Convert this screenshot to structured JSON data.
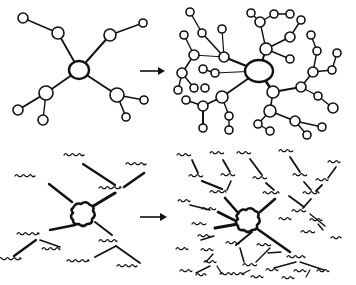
{
  "diagram": {
    "title": "",
    "panels": [
      {
        "id": "simple-network",
        "kind": "node-graph",
        "hub": {
          "x": 79,
          "y": 70,
          "rx": 10,
          "ry": 9
        },
        "nodes": [
          {
            "x": 23,
            "y": 18,
            "r": 5
          },
          {
            "x": 58,
            "y": 33,
            "r": 6
          },
          {
            "x": 110,
            "y": 35,
            "r": 6
          },
          {
            "x": 143,
            "y": 23,
            "r": 4
          },
          {
            "x": 46,
            "y": 93,
            "r": 7
          },
          {
            "x": 18,
            "y": 110,
            "r": 5
          },
          {
            "x": 43,
            "y": 120,
            "r": 5
          },
          {
            "x": 117,
            "y": 95,
            "r": 7
          },
          {
            "x": 144,
            "y": 100,
            "r": 4
          },
          {
            "x": 126,
            "y": 117,
            "r": 4
          }
        ],
        "edges": [
          [
            23,
            18,
            58,
            33,
            1.4
          ],
          [
            58,
            33,
            79,
            70,
            1.8
          ],
          [
            110,
            35,
            79,
            70,
            2
          ],
          [
            110,
            35,
            143,
            23,
            1.4
          ],
          [
            79,
            70,
            46,
            93,
            1.8
          ],
          [
            46,
            93,
            18,
            110,
            2
          ],
          [
            46,
            93,
            43,
            120,
            1.4
          ],
          [
            79,
            70,
            117,
            95,
            1.8
          ],
          [
            117,
            95,
            144,
            100,
            1.4
          ],
          [
            117,
            95,
            126,
            117,
            1.6
          ]
        ]
      },
      {
        "id": "complex-network",
        "kind": "node-graph",
        "hub": {
          "x": 259,
          "y": 71,
          "rx": 14,
          "ry": 11
        },
        "nodes": [
          {
            "x": 190,
            "y": 12,
            "r": 4
          },
          {
            "x": 202,
            "y": 33,
            "r": 4
          },
          {
            "x": 222,
            "y": 29,
            "r": 4
          },
          {
            "x": 184,
            "y": 35,
            "r": 4
          },
          {
            "x": 194,
            "y": 55,
            "r": 5
          },
          {
            "x": 224,
            "y": 57,
            "r": 5
          },
          {
            "x": 182,
            "y": 73,
            "r": 5
          },
          {
            "x": 178,
            "y": 90,
            "r": 4
          },
          {
            "x": 194,
            "y": 88,
            "r": 4
          },
          {
            "x": 203,
            "y": 69,
            "r": 4
          },
          {
            "x": 215,
            "y": 73,
            "r": 4
          },
          {
            "x": 205,
            "y": 88,
            "r": 4
          },
          {
            "x": 186,
            "y": 100,
            "r": 4
          },
          {
            "x": 203,
            "y": 106,
            "r": 5
          },
          {
            "x": 222,
            "y": 97,
            "r": 6
          },
          {
            "x": 203,
            "y": 128,
            "r": 4
          },
          {
            "x": 229,
            "y": 116,
            "r": 4
          },
          {
            "x": 229,
            "y": 130,
            "r": 4
          },
          {
            "x": 251,
            "y": 13,
            "r": 4
          },
          {
            "x": 260,
            "y": 22,
            "r": 5
          },
          {
            "x": 274,
            "y": 14,
            "r": 4
          },
          {
            "x": 290,
            "y": 14,
            "r": 4
          },
          {
            "x": 266,
            "y": 49,
            "r": 6
          },
          {
            "x": 290,
            "y": 37,
            "r": 5
          },
          {
            "x": 301,
            "y": 20,
            "r": 4
          },
          {
            "x": 290,
            "y": 59,
            "r": 4
          },
          {
            "x": 311,
            "y": 35,
            "r": 4
          },
          {
            "x": 317,
            "y": 51,
            "r": 4
          },
          {
            "x": 313,
            "y": 72,
            "r": 5
          },
          {
            "x": 332,
            "y": 70,
            "r": 4
          },
          {
            "x": 337,
            "y": 53,
            "r": 4
          },
          {
            "x": 273,
            "y": 92,
            "r": 6
          },
          {
            "x": 301,
            "y": 87,
            "r": 5
          },
          {
            "x": 318,
            "y": 96,
            "r": 4
          },
          {
            "x": 333,
            "y": 108,
            "r": 5
          },
          {
            "x": 270,
            "y": 111,
            "r": 6
          },
          {
            "x": 258,
            "y": 124,
            "r": 4
          },
          {
            "x": 270,
            "y": 131,
            "r": 4
          },
          {
            "x": 295,
            "y": 121,
            "r": 5
          },
          {
            "x": 307,
            "y": 135,
            "r": 4
          },
          {
            "x": 322,
            "y": 127,
            "r": 4
          }
        ],
        "edges": [
          [
            190,
            12,
            202,
            33,
            1.4
          ],
          [
            202,
            33,
            224,
            57,
            1.6
          ],
          [
            222,
            29,
            224,
            57,
            1.2
          ],
          [
            184,
            35,
            194,
            55,
            1.4
          ],
          [
            194,
            55,
            224,
            57,
            1
          ],
          [
            194,
            55,
            182,
            73,
            1.6
          ],
          [
            224,
            57,
            259,
            71,
            2.4
          ],
          [
            182,
            73,
            178,
            90,
            1.4
          ],
          [
            182,
            73,
            194,
            88,
            1.4
          ],
          [
            203,
            69,
            215,
            73,
            1.4
          ],
          [
            215,
            73,
            259,
            71,
            1
          ],
          [
            222,
            97,
            259,
            71,
            1.8
          ],
          [
            222,
            97,
            203,
            106,
            1.6
          ],
          [
            203,
            106,
            186,
            100,
            1.4
          ],
          [
            203,
            106,
            203,
            128,
            2
          ],
          [
            222,
            97,
            229,
            116,
            1.4
          ],
          [
            229,
            116,
            229,
            130,
            1.4
          ],
          [
            251,
            13,
            260,
            22,
            1.4
          ],
          [
            260,
            22,
            274,
            14,
            1.4
          ],
          [
            274,
            14,
            290,
            14,
            1.4
          ],
          [
            260,
            22,
            266,
            49,
            1.4
          ],
          [
            266,
            49,
            259,
            71,
            2
          ],
          [
            266,
            49,
            290,
            37,
            1.6
          ],
          [
            290,
            37,
            301,
            20,
            1.4
          ],
          [
            266,
            49,
            290,
            59,
            1.4
          ],
          [
            311,
            35,
            317,
            51,
            1.4
          ],
          [
            317,
            51,
            313,
            72,
            1.4
          ],
          [
            313,
            72,
            332,
            70,
            1.4
          ],
          [
            332,
            70,
            337,
            53,
            1.4
          ],
          [
            313,
            72,
            301,
            87,
            1.6
          ],
          [
            301,
            87,
            273,
            92,
            1.8
          ],
          [
            273,
            92,
            259,
            71,
            2.6
          ],
          [
            301,
            87,
            318,
            96,
            1.4
          ],
          [
            318,
            96,
            333,
            108,
            1.4
          ],
          [
            273,
            92,
            270,
            111,
            1.6
          ],
          [
            270,
            111,
            258,
            124,
            1.4
          ],
          [
            258,
            124,
            270,
            131,
            1.4
          ],
          [
            270,
            111,
            295,
            121,
            1.6
          ],
          [
            295,
            121,
            307,
            135,
            1.4
          ],
          [
            295,
            121,
            322,
            127,
            1.4
          ]
        ]
      },
      {
        "id": "simple-word-cluster",
        "kind": "word-cluster",
        "blob": {
          "x": 82,
          "y": 214
        },
        "words": [
          {
            "x": 74,
            "y": 155,
            "w": 20
          },
          {
            "x": 136,
            "y": 164,
            "w": 20
          },
          {
            "x": 25,
            "y": 176,
            "w": 20
          },
          {
            "x": 110,
            "y": 188,
            "w": 22
          },
          {
            "x": 28,
            "y": 234,
            "w": 22
          },
          {
            "x": 51,
            "y": 249,
            "w": 18
          },
          {
            "x": 10,
            "y": 259,
            "w": 22
          },
          {
            "x": 108,
            "y": 241,
            "w": 18
          },
          {
            "x": 78,
            "y": 261,
            "w": 22
          },
          {
            "x": 127,
            "y": 266,
            "w": 20
          }
        ],
        "edges": [
          [
            83,
            164,
            115,
            185,
            2.2
          ],
          [
            144,
            173,
            124,
            187,
            2.6
          ],
          [
            49,
            184,
            72,
            202,
            2.4
          ],
          [
            115,
            193,
            90,
            208,
            3
          ],
          [
            75,
            225,
            50,
            230,
            2.4
          ],
          [
            95,
            222,
            112,
            235,
            2
          ],
          [
            36,
            240,
            14,
            256,
            2.2
          ],
          [
            40,
            240,
            60,
            247,
            1.6
          ],
          [
            116,
            246,
            95,
            257,
            1.8
          ],
          [
            116,
            246,
            140,
            263,
            1.8
          ]
        ]
      },
      {
        "id": "complex-word-cluster",
        "kind": "word-cluster",
        "blob": {
          "x": 247,
          "y": 220
        },
        "words": [
          {
            "x": 184,
            "y": 155,
            "w": 14
          },
          {
            "x": 217,
            "y": 153,
            "w": 14
          },
          {
            "x": 244,
            "y": 153,
            "w": 14
          },
          {
            "x": 286,
            "y": 151,
            "w": 14
          },
          {
            "x": 334,
            "y": 162,
            "w": 12
          },
          {
            "x": 196,
            "y": 176,
            "w": 14
          },
          {
            "x": 228,
            "y": 175,
            "w": 14
          },
          {
            "x": 260,
            "y": 178,
            "w": 14
          },
          {
            "x": 300,
            "y": 175,
            "w": 14
          },
          {
            "x": 322,
            "y": 180,
            "w": 12
          },
          {
            "x": 218,
            "y": 192,
            "w": 16
          },
          {
            "x": 271,
            "y": 193,
            "w": 16
          },
          {
            "x": 311,
            "y": 193,
            "w": 16
          },
          {
            "x": 184,
            "y": 201,
            "w": 12
          },
          {
            "x": 209,
            "y": 209,
            "w": 14
          },
          {
            "x": 299,
            "y": 211,
            "w": 14
          },
          {
            "x": 285,
            "y": 219,
            "w": 12
          },
          {
            "x": 316,
            "y": 220,
            "w": 12
          },
          {
            "x": 199,
            "y": 224,
            "w": 14
          },
          {
            "x": 308,
            "y": 232,
            "w": 14
          },
          {
            "x": 336,
            "y": 238,
            "w": 10
          },
          {
            "x": 204,
            "y": 236,
            "w": 12
          },
          {
            "x": 264,
            "y": 245,
            "w": 14
          },
          {
            "x": 207,
            "y": 250,
            "w": 12
          },
          {
            "x": 233,
            "y": 243,
            "w": 14
          },
          {
            "x": 182,
            "y": 249,
            "w": 12
          },
          {
            "x": 210,
            "y": 262,
            "w": 12
          },
          {
            "x": 250,
            "y": 265,
            "w": 14
          },
          {
            "x": 296,
            "y": 257,
            "w": 18
          },
          {
            "x": 226,
            "y": 274,
            "w": 12
          },
          {
            "x": 272,
            "y": 270,
            "w": 12
          },
          {
            "x": 186,
            "y": 271,
            "w": 12
          },
          {
            "x": 238,
            "y": 274,
            "w": 12
          },
          {
            "x": 300,
            "y": 271,
            "w": 12
          },
          {
            "x": 323,
            "y": 271,
            "w": 12
          },
          {
            "x": 288,
            "y": 278,
            "w": 12
          },
          {
            "x": 201,
            "y": 275,
            "w": 10
          },
          {
            "x": 257,
            "y": 277,
            "w": 12
          }
        ],
        "edges": [
          [
            192,
            160,
            198,
            173,
            1.8
          ],
          [
            223,
            160,
            230,
            172,
            1.8
          ],
          [
            250,
            159,
            262,
            175,
            1.8
          ],
          [
            290,
            157,
            300,
            172,
            1.8
          ],
          [
            336,
            167,
            328,
            178,
            1.6
          ],
          [
            202,
            181,
            222,
            189,
            2.2
          ],
          [
            231,
            181,
            227,
            190,
            1.6
          ],
          [
            266,
            183,
            274,
            190,
            1.8
          ],
          [
            304,
            182,
            311,
            190,
            1.8
          ],
          [
            322,
            185,
            316,
            191,
            1.8
          ],
          [
            225,
            198,
            240,
            215,
            2.6
          ],
          [
            275,
            199,
            260,
            212,
            2.6
          ],
          [
            311,
            199,
            303,
            208,
            1.8
          ],
          [
            289,
            196,
            304,
            207,
            1.8
          ],
          [
            190,
            205,
            210,
            210,
            1.6
          ],
          [
            218,
            212,
            238,
            222,
            2.6
          ],
          [
            215,
            228,
            238,
            224,
            3
          ],
          [
            318,
            224,
            323,
            230,
            1.4
          ],
          [
            310,
            214,
            325,
            226,
            1.4
          ],
          [
            256,
            228,
            290,
            252,
            2.6
          ],
          [
            252,
            232,
            236,
            245,
            2
          ],
          [
            240,
            248,
            244,
            262,
            1.6
          ],
          [
            270,
            248,
            256,
            262,
            1.4
          ],
          [
            201,
            240,
            214,
            236,
            1.4
          ],
          [
            213,
            254,
            206,
            262,
            1.4
          ],
          [
            268,
            253,
            281,
            252,
            1.4
          ],
          [
            210,
            266,
            196,
            273,
            1.4
          ],
          [
            217,
            266,
            222,
            274,
            1.4
          ],
          [
            296,
            262,
            274,
            268,
            1.4
          ],
          [
            300,
            262,
            324,
            270,
            1.4
          ],
          [
            310,
            270,
            306,
            277,
            1.2
          ],
          [
            250,
            270,
            242,
            274,
            1.2
          ]
        ]
      }
    ],
    "arrows": [
      {
        "id": "top-arrow",
        "x1": 140,
        "y1": 71,
        "x2": 165,
        "y2": 71
      },
      {
        "id": "bottom-arrow",
        "x1": 140,
        "y1": 217,
        "x2": 167,
        "y2": 217
      }
    ]
  }
}
